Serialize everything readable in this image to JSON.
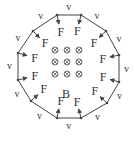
{
  "diagram": {
    "field_label": "B",
    "field_symbol": "⊗",
    "velocity_label": "v",
    "force_label": "F",
    "vertices": [
      [
        57,
        15
      ],
      [
        81,
        15
      ],
      [
        106,
        31
      ],
      [
        119,
        55
      ],
      [
        119,
        82
      ],
      [
        107,
        103
      ],
      [
        81,
        118
      ],
      [
        57,
        118
      ],
      [
        31,
        101
      ],
      [
        18,
        80
      ],
      [
        18,
        53
      ],
      [
        33,
        31
      ]
    ],
    "field_grid": {
      "rows": 3,
      "cols": 3,
      "x0": 55,
      "y0": 50,
      "dx": 12,
      "dy": 12
    },
    "colors": {
      "line": "#444444",
      "text": "#333333"
    }
  }
}
